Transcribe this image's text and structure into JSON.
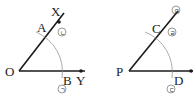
{
  "figure_left": {
    "vertex": "O",
    "ray_upper_point_far": "X",
    "ray_upper_point_arc": "A",
    "ray_lower_point_arc": "B",
    "ray_lower_point_far": "Y",
    "mark_near_A": "ㄴ",
    "mark_below_B": "ㄱ"
  },
  "figure_right": {
    "vertex": "P",
    "ray_upper_point_arc": "C",
    "ray_lower_point_arc": "D",
    "ray_lower_point_far": "Q",
    "mark_near_C": "ㄹ",
    "mark_top": "ㅁ",
    "mark_below_D": "ㄷ"
  },
  "colors": {
    "line": "#1a1a1a",
    "arc": "#888888"
  }
}
